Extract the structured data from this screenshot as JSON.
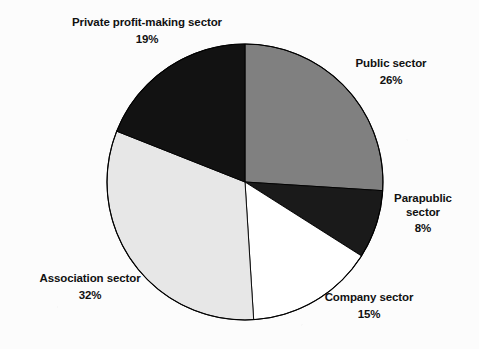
{
  "chart_data": {
    "type": "pie",
    "title": "",
    "subtitle": "",
    "xlabel": "",
    "ylabel": "",
    "legend_position": "none",
    "grid": false,
    "units": "percent",
    "total": 100,
    "start_angle_deg": 0,
    "direction": "clockwise",
    "categories": [
      "Public sector",
      "Parapublic sector",
      "Company sector",
      "Association sector",
      "Private profit-making sector"
    ],
    "values": [
      26,
      8,
      15,
      32,
      19
    ],
    "slices": [
      {
        "label": "Public sector",
        "label_line1": "Public sector",
        "label_line2": "",
        "value": 26,
        "value_text": "26%",
        "color": "#808080",
        "start_deg": 0,
        "end_deg": 93.6
      },
      {
        "label": "Parapublic sector",
        "label_line1": "Parapublic",
        "label_line2": "sector",
        "value": 8,
        "value_text": "8%",
        "color": "#1a1a1a",
        "start_deg": 93.6,
        "end_deg": 122.4
      },
      {
        "label": "Company sector",
        "label_line1": "Company sector",
        "label_line2": "",
        "value": 15,
        "value_text": "15%",
        "color": "#ffffff",
        "start_deg": 122.4,
        "end_deg": 176.4
      },
      {
        "label": "Association sector",
        "label_line1": "Association sector",
        "label_line2": "",
        "value": 32,
        "value_text": "32%",
        "color": "#e7e7e7",
        "start_deg": 176.4,
        "end_deg": 291.6
      },
      {
        "label": "Private profit-making sector",
        "label_line1": "Private profit-making sector",
        "label_line2": "",
        "value": 19,
        "value_text": "19%",
        "color": "#121212",
        "start_deg": 291.6,
        "end_deg": 360
      }
    ],
    "geometry": {
      "center_x": 245,
      "center_y": 182,
      "radius": 138
    },
    "colors": {
      "background": "#fcfcfc",
      "outline": "#000000",
      "text": "#111111"
    }
  }
}
